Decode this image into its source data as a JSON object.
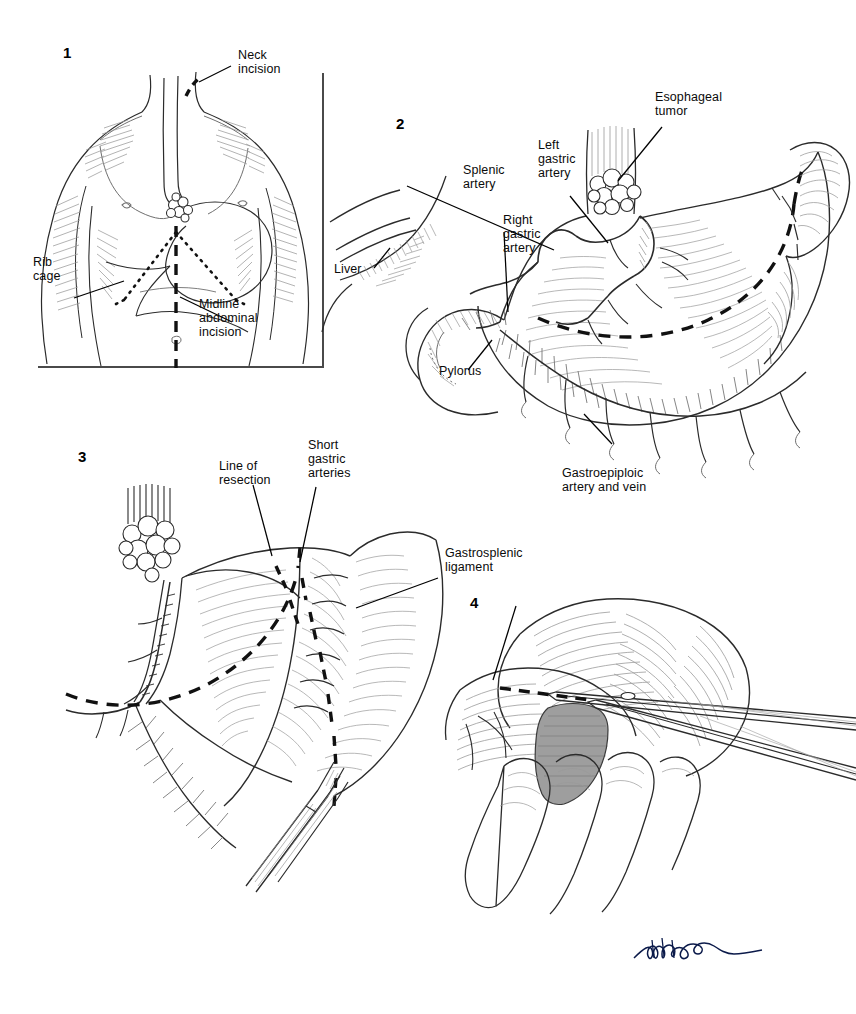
{
  "figure": {
    "type": "medical-surgical-illustration",
    "style": "pen-and-ink line drawing, grayscale",
    "background_color": "#ffffff",
    "ink_color": "#2b2b2b",
    "panel_count": 4
  },
  "panels": [
    {
      "number": "1",
      "name": "incision-planning",
      "description": "Anterior torso showing planned neck incision and midline abdominal incision with rib cage outline",
      "has_border": true,
      "labels": [
        {
          "id": "neck-incision",
          "text": "Neck\nincision"
        },
        {
          "id": "rib-cage",
          "text": "Rib\ncage"
        },
        {
          "id": "midline-abdominal-incision",
          "text": "Midline\nabdominal\nincision"
        }
      ]
    },
    {
      "number": "2",
      "name": "gastric-vascular-anatomy",
      "description": "Stomach with esophagus, tumor, and named arteries; dashed line of resection",
      "has_border": false,
      "labels": [
        {
          "id": "esophageal-tumor",
          "text": "Esophageal\ntumor"
        },
        {
          "id": "left-gastric-artery",
          "text": "Left\ngastric\nartery"
        },
        {
          "id": "splenic-artery",
          "text": "Splenic\nartery"
        },
        {
          "id": "right-gastric-artery",
          "text": "Right\ngastric\nartery"
        },
        {
          "id": "liver",
          "text": "Liver"
        },
        {
          "id": "pylorus",
          "text": "Pylorus"
        },
        {
          "id": "gastroepiploic-artery-and-vein",
          "text": "Gastroepiploic\nartery and vein"
        }
      ]
    },
    {
      "number": "3",
      "name": "line-of-resection",
      "description": "Mobilized stomach with dashed resection line along lesser curvature and short gastric arteries; clamp applied",
      "has_border": false,
      "labels": [
        {
          "id": "line-of-resection",
          "text": "Line of\nresection"
        },
        {
          "id": "short-gastric-arteries",
          "text": "Short\ngastric\narteries"
        },
        {
          "id": "gastrosplenic-ligament",
          "text": "Gastrosplenic\nligament"
        }
      ]
    },
    {
      "number": "4",
      "name": "gastrosplenic-ligament-division",
      "description": "Close-up of surgeon's fingers retracting while clamps divide the gastrosplenic ligament along a dashed line",
      "has_border": false,
      "labels": []
    }
  ],
  "annotations": {
    "signature": {
      "id": "artist-signature",
      "text": "M Bidani",
      "rendered_as": "handwritten-script"
    }
  },
  "anatomy_terms": [
    "Neck incision",
    "Rib cage",
    "Midline abdominal incision",
    "Esophageal tumor",
    "Left gastric artery",
    "Splenic artery",
    "Right gastric artery",
    "Liver",
    "Pylorus",
    "Gastroepiploic artery and vein",
    "Line of resection",
    "Short gastric arteries",
    "Gastrosplenic ligament"
  ]
}
